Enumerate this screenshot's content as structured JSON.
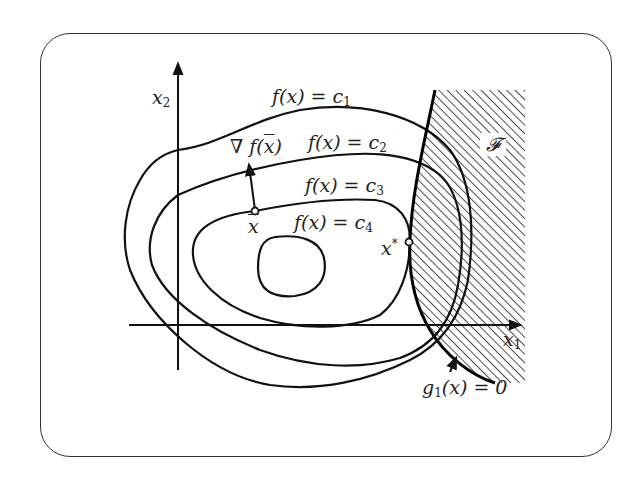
{
  "diagram": {
    "type": "optimization-contour-plot",
    "axes": {
      "x_label": "x",
      "x_subscript": "1",
      "y_label": "x",
      "y_subscript": "2"
    },
    "level_sets": [
      {
        "label_f": "f(x) = c",
        "subscript": "1"
      },
      {
        "label_f": "f(x) = c",
        "subscript": "2"
      },
      {
        "label_f": "f(x) = c",
        "subscript": "3"
      },
      {
        "label_f": "f(x) = c",
        "subscript": "4"
      }
    ],
    "gradient_label": "∇ f(x̄)",
    "gradient_prefix": "∇",
    "gradient_f": "f(",
    "gradient_x": "x",
    "gradient_close": ")",
    "point_xbar": "x",
    "point_xstar": "x",
    "point_xstar_sup": "*",
    "feasible_region_label": "𝓕",
    "constraint_label_g": "g",
    "constraint_subscript": "1",
    "constraint_rest": "(x) = 0",
    "colors": {
      "stroke": "#111111",
      "hatch": "#222222",
      "frame": "#333333",
      "background": "#ffffff"
    }
  }
}
